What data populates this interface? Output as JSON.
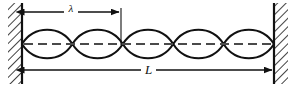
{
  "figure": {
    "background_color": "#ffffff",
    "ink_color": "#111111",
    "axis_color": "#4a4a4a"
  },
  "labels": {
    "wavelength": "λ",
    "length": "L"
  },
  "geometry": {
    "left_wall_x": 22,
    "right_wall_x": 274,
    "axis_y": 44,
    "loop_count": 5,
    "loop_width": 50.4,
    "amplitude": 16,
    "wavelength_arrow_y": 12,
    "wavelength_arrow_x1": 22,
    "wavelength_arrow_x2": 121,
    "length_arrow_y": 70,
    "length_arrow_x1": 22,
    "length_arrow_x2": 274,
    "tick_x": 121,
    "tick_y_top": 8,
    "tick_y_bottom": 44
  },
  "nodes": {
    "positions_x": [
      22,
      72.4,
      122.8,
      173.2,
      223.6,
      274
    ],
    "note": "string nodes where displacement is zero"
  },
  "walls": {
    "left": {
      "name": "left-rigid-support",
      "hatch_side": "left"
    },
    "right": {
      "name": "right-rigid-support",
      "hatch_side": "right"
    }
  }
}
